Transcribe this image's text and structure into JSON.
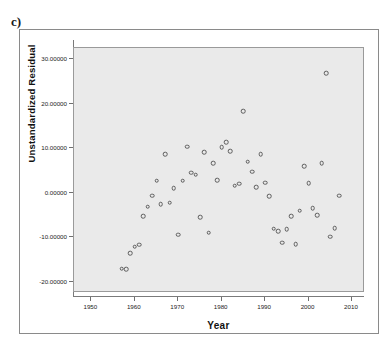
{
  "panel": {
    "label": "c)"
  },
  "chart_data": {
    "type": "scatter",
    "title": "",
    "xlabel": "Year",
    "ylabel": "Unstandardized Residual",
    "xlim": [
      1946,
      2013
    ],
    "ylim": [
      -22.5,
      32.5
    ],
    "grid": false,
    "legend": null,
    "x_ticks": [
      "1950",
      "1960",
      "1970",
      "1980",
      "1990",
      "2000",
      "2010"
    ],
    "x_tick_values": [
      1950,
      1960,
      1970,
      1980,
      1990,
      2000,
      2010
    ],
    "y_ticks": [
      "30.00000",
      "20.00000",
      "10.00000",
      "0.00000",
      "-10.00000",
      "-20.00000"
    ],
    "y_tick_values": [
      30,
      20,
      10,
      0,
      -10,
      -20
    ],
    "marker": "open-circle",
    "marker_color": "#5c5c5c",
    "plot_background": "#eaeaea",
    "points": [
      {
        "x": 1957,
        "y": -17.0
      },
      {
        "x": 1958,
        "y": -17.1
      },
      {
        "x": 1959,
        "y": -13.5
      },
      {
        "x": 1960,
        "y": -12.1
      },
      {
        "x": 1961,
        "y": -11.7
      },
      {
        "x": 1962,
        "y": -5.3
      },
      {
        "x": 1963,
        "y": -3.1
      },
      {
        "x": 1964,
        "y": -0.7
      },
      {
        "x": 1965,
        "y": 2.7
      },
      {
        "x": 1966,
        "y": -2.5
      },
      {
        "x": 1967,
        "y": 8.7
      },
      {
        "x": 1968,
        "y": -2.2
      },
      {
        "x": 1969,
        "y": 1.0
      },
      {
        "x": 1970,
        "y": -9.4
      },
      {
        "x": 1971,
        "y": 2.7
      },
      {
        "x": 1972,
        "y": 10.3
      },
      {
        "x": 1973,
        "y": 4.5
      },
      {
        "x": 1974,
        "y": 4.1
      },
      {
        "x": 1975,
        "y": -5.5
      },
      {
        "x": 1976,
        "y": 9.1
      },
      {
        "x": 1977,
        "y": -9.0
      },
      {
        "x": 1978,
        "y": 6.7
      },
      {
        "x": 1979,
        "y": 2.8
      },
      {
        "x": 1980,
        "y": 10.2
      },
      {
        "x": 1981,
        "y": 11.3
      },
      {
        "x": 1982,
        "y": 9.3
      },
      {
        "x": 1983,
        "y": 1.6
      },
      {
        "x": 1984,
        "y": 2.0
      },
      {
        "x": 1985,
        "y": 18.3
      },
      {
        "x": 1986,
        "y": 7.0
      },
      {
        "x": 1987,
        "y": 4.7
      },
      {
        "x": 1988,
        "y": 1.3
      },
      {
        "x": 1989,
        "y": 8.6
      },
      {
        "x": 1990,
        "y": 2.3
      },
      {
        "x": 1991,
        "y": -0.8
      },
      {
        "x": 1992,
        "y": -8.1
      },
      {
        "x": 1993,
        "y": -8.6
      },
      {
        "x": 1994,
        "y": -11.2
      },
      {
        "x": 1995,
        "y": -8.2
      },
      {
        "x": 1996,
        "y": -5.2
      },
      {
        "x": 1997,
        "y": -11.6
      },
      {
        "x": 1998,
        "y": -4.0
      },
      {
        "x": 1999,
        "y": 6.0
      },
      {
        "x": 2000,
        "y": 2.2
      },
      {
        "x": 2001,
        "y": -3.4
      },
      {
        "x": 2002,
        "y": -5.0
      },
      {
        "x": 2003,
        "y": 6.7
      },
      {
        "x": 2004,
        "y": 26.8
      },
      {
        "x": 2005,
        "y": -9.9
      },
      {
        "x": 2006,
        "y": -8.0
      },
      {
        "x": 2007,
        "y": -0.7
      }
    ]
  }
}
